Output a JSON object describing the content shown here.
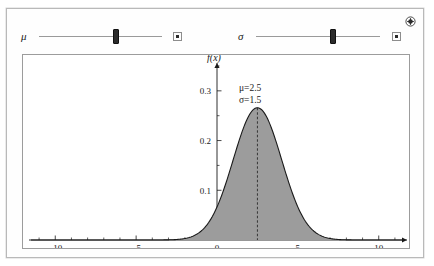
{
  "window": {
    "add_icon": "plus-circle-icon"
  },
  "controls": [
    {
      "name": "mu",
      "label": "μ",
      "value": 2.5,
      "min": -10,
      "max": 10,
      "fraction": 0.625,
      "play_label": "■"
    },
    {
      "name": "sigma",
      "label": "σ",
      "value": 1.5,
      "min": 0.1,
      "max": 5,
      "fraction": 0.62,
      "play_label": "■"
    }
  ],
  "annotations": {
    "mu_text": "μ=2.5",
    "sigma_text": "σ=1.5"
  },
  "chart_data": {
    "type": "line",
    "title": "",
    "xlabel": "x",
    "ylabel": "f(x)",
    "xlim": [
      -11.5,
      11.5
    ],
    "ylim": [
      0,
      0.36
    ],
    "xticks": [
      -10,
      -5,
      0,
      5,
      10
    ],
    "xticklabels": [
      "−10",
      "−5",
      "0",
      "5",
      "10"
    ],
    "xminorticks": [
      -11,
      -9,
      -8,
      -7,
      -6,
      -4,
      -3,
      -2,
      -1,
      1,
      2,
      3,
      4,
      6,
      7,
      8,
      9,
      11
    ],
    "yticks": [
      0.1,
      0.2,
      0.3
    ],
    "yticklabels": [
      "0.1",
      "0.2",
      "0.3"
    ],
    "yminorticks": [
      0.05,
      0.15,
      0.25,
      0.35
    ],
    "grid": false,
    "legend": false,
    "fill": "#9c9c9c",
    "stroke": "#1a1a1a",
    "mean_line": 2.5,
    "series": [
      {
        "name": "normal-pdf",
        "mu": 2.5,
        "sigma": 1.5,
        "peak": 0.266,
        "x": [
          -11.5,
          -11,
          -10.5,
          -10,
          -9.5,
          -9,
          -8.5,
          -8,
          -7.5,
          -7,
          -6.5,
          -6,
          -5.5,
          -5,
          -4.5,
          -4,
          -3.5,
          -3,
          -2.5,
          -2,
          -1.5,
          -1,
          -0.5,
          0,
          0.5,
          1,
          1.5,
          2,
          2.5,
          3,
          3.5,
          4,
          4.5,
          5,
          5.5,
          6,
          6.5,
          7,
          7.5,
          8,
          8.5,
          9,
          9.5,
          10,
          10.5,
          11,
          11.5
        ],
        "y": [
          0.0,
          0.0,
          0.0,
          0.0,
          0.0,
          0.0,
          0.0,
          0.0,
          0.0,
          0.0,
          0.0,
          0.0,
          0.0,
          0.0,
          0.0,
          0.0,
          0.0001,
          0.0004,
          0.0015,
          0.0049,
          0.0137,
          0.0331,
          0.0688,
          0.123,
          0.1895,
          0.2516,
          0.2877,
          0.2836,
          0.266,
          0.2836,
          0.2877,
          0.2516,
          0.1895,
          0.123,
          0.0688,
          0.0331,
          0.0137,
          0.0049,
          0.0015,
          0.0004,
          0.0001,
          0.0,
          0.0,
          0.0,
          0.0,
          0.0,
          0.0
        ]
      }
    ]
  }
}
